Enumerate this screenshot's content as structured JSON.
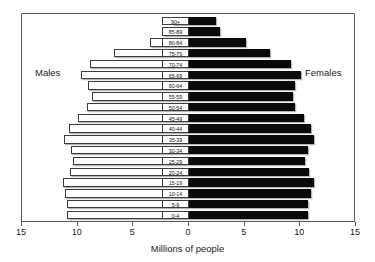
{
  "chart_data": {
    "type": "bar",
    "subtype": "population-pyramid",
    "title": "",
    "xlabel": "Millions of people",
    "ylabel": "",
    "xlim": [
      -15,
      15
    ],
    "xticks": [
      15,
      10,
      5,
      0,
      5,
      10,
      15
    ],
    "grid": false,
    "legend_position": "inside-top",
    "categories": [
      "90+",
      "85-89",
      "80-84",
      "75-79",
      "70-74",
      "65-69",
      "60-64",
      "55-59",
      "50-54",
      "45-49",
      "40-44",
      "35-39",
      "30-34",
      "25-29",
      "20-24",
      "15-19",
      "10-14",
      "5-9",
      "0-4"
    ],
    "series": [
      {
        "name": "Males",
        "side": "left",
        "color": "#ffffff",
        "values": [
          1.4,
          2.3,
          3.5,
          6.7,
          8.9,
          9.7,
          9.1,
          8.7,
          9.2,
          10.0,
          10.8,
          11.2,
          10.6,
          10.4,
          10.7,
          11.3,
          11.1,
          11.0,
          11.0
        ]
      },
      {
        "name": "Females",
        "side": "right",
        "color": "#0a0a0a",
        "values": [
          2.4,
          2.8,
          5.1,
          7.3,
          9.2,
          10.1,
          9.5,
          9.3,
          9.5,
          10.3,
          11.0,
          11.2,
          10.7,
          10.4,
          10.8,
          11.2,
          11.0,
          10.7,
          10.7
        ]
      }
    ],
    "annotations": [
      {
        "text": "Males",
        "position": "left"
      },
      {
        "text": "Females",
        "position": "right"
      }
    ]
  },
  "axis": {
    "x_title": "Millions of people",
    "tick_labels": [
      "15",
      "10",
      "5",
      "0",
      "5",
      "10",
      "15"
    ]
  },
  "captions": {
    "males": "Males",
    "females": "Females"
  },
  "colors": {
    "male_bar": "#ffffff",
    "female_bar": "#0a0a0a",
    "frame": "#5a5a5a",
    "text": "#1a1a1a"
  }
}
